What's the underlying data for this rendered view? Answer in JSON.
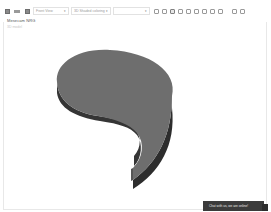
{
  "toolbar": {
    "file_icons": [
      "save-icon",
      "print-icon",
      "export-icon"
    ],
    "view_dropdown": {
      "value": "Front View"
    },
    "render_dropdown": {
      "value": "3D Shaded coloring"
    },
    "third_dropdown": {
      "value": ""
    },
    "view_tools": [
      "zoom-fit-icon",
      "zoom-in-icon",
      "zoom-window-icon",
      "pan-icon",
      "rotate-icon",
      "box-view-icon",
      "section-icon",
      "measure-icon",
      "explode-icon",
      "settings-icon",
      "help-icon"
    ],
    "active_tool_index": 2
  },
  "model": {
    "title": "Mesecam NRG",
    "subtitle": "3D model",
    "shape": "extruded-comma",
    "colors": {
      "top_face": "#6f6f6f",
      "side_face_dark": "#2f2f2f",
      "side_face_light": "#4a4a4a"
    }
  },
  "chat": {
    "label": "Chat with us, we are online!",
    "background": "#3b3b3b"
  }
}
